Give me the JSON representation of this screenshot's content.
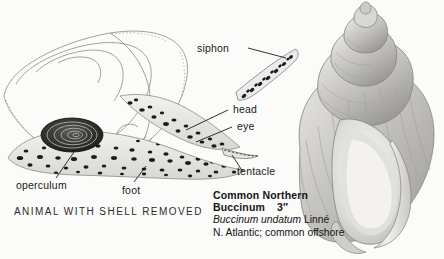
{
  "page": {
    "background_color": "#fbfbfa",
    "width": 444,
    "height": 259
  },
  "figure": {
    "type": "natural-history-plate",
    "panels": [
      {
        "name": "animal-with-shell-removed",
        "caption": "ANIMAL WITH SHELL REMOVED"
      },
      {
        "name": "shell-illustration",
        "caption": "Common Northern Buccinum"
      }
    ]
  },
  "callouts": {
    "siphon": "siphon",
    "head": "head",
    "eye": "eye",
    "tentacle": "tentacle",
    "operculum": "operculum",
    "foot": "foot"
  },
  "left_caption": {
    "text": "ANIMAL WITH SHELL REMOVED"
  },
  "species_caption": {
    "common_name_line1": "Common Northern",
    "common_name_line2": "Buccinum",
    "size": "3″",
    "scientific_name": "Buccinum undatum",
    "authority": "Linné",
    "range": "N. Atlantic; common offshore"
  },
  "colors": {
    "ink": "#191919",
    "shell_gray": "#b9b8b4",
    "shell_light": "#e6e5e1",
    "shell_shadow": "#8f8e8a",
    "operculum_dark": "#1a1a1a",
    "background": "#fbfbfa"
  }
}
